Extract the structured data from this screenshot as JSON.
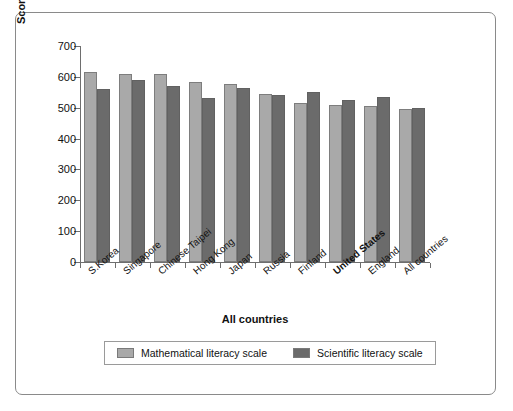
{
  "chart_data": {
    "type": "bar",
    "title": "",
    "xlabel": "All countries",
    "ylabel": "Scores on math and science literacy scales for 8th graders",
    "ylim": [
      0,
      700
    ],
    "yticks": [
      0,
      100,
      200,
      300,
      400,
      500,
      600,
      700
    ],
    "grid": false,
    "legend_position": "bottom",
    "highlight_category": "United States",
    "categories": [
      "S.Korea",
      "Singapore",
      "Chinese Taipei",
      "Hong Kong",
      "Japan",
      "Russia",
      "Finland",
      "United States",
      "England",
      "All countries"
    ],
    "series": [
      {
        "name": "Mathematical literacy scale",
        "color": "#a9a9a9",
        "values": [
          615,
          610,
          610,
          585,
          578,
          545,
          515,
          510,
          505,
          495
        ]
      },
      {
        "name": "Scientific literacy scale",
        "color": "#6b6b6b",
        "values": [
          560,
          590,
          570,
          530,
          565,
          540,
          550,
          525,
          535,
          500
        ]
      }
    ]
  },
  "legend": {
    "items": [
      {
        "label": "Mathematical literacy scale",
        "swatch": "math"
      },
      {
        "label": "Scientific literacy scale",
        "swatch": "sci"
      }
    ]
  },
  "colors": {
    "math_bar": "#a9a9a9",
    "sci_bar": "#6b6b6b",
    "axis": "#6e6e6e",
    "frame": "#8a8a8a",
    "background": "#ffffff"
  }
}
